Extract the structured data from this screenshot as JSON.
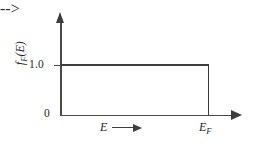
{
  "chart_data": {
    "type": "line",
    "title": "",
    "subtitle": "",
    "xlabel": "E",
    "ylabel": "f",
    "ylabel_sub": "F",
    "ylabel_arg": "(E)",
    "ylabel_full": "f_F(E)",
    "xlabel_arrow": "→",
    "x_tick_labels": [
      "0",
      "E_F"
    ],
    "y_tick_labels": [
      "0",
      "1.0"
    ],
    "y_tick_values": [
      0,
      1.0
    ],
    "ylim": [
      0,
      1.15
    ],
    "xlim": [
      0,
      1.2
    ],
    "grid": false,
    "legend": false,
    "series": [
      {
        "name": "Fermi-Dirac distribution at T = 0 K",
        "x": [
          0,
          1.0,
          1.0,
          1.2
        ],
        "values": [
          1.0,
          1.0,
          0,
          0
        ]
      }
    ],
    "annotations": [
      {
        "name": "fermi-energy-marker",
        "text": "E_F",
        "x": 1.0,
        "y": 0
      },
      {
        "name": "x-axis-direction-arrow",
        "text": "E →",
        "x": 0.5,
        "y": 0
      }
    ],
    "axis_arrows": {
      "x": true,
      "y": true
    },
    "line_color": "#3d3d3d",
    "axis_color": "#4a4a4a",
    "background_color": "#ffffff"
  },
  "axes": {
    "y_tick_one": "1.0",
    "origin_label": "0",
    "y_title_f": "f",
    "y_title_sub": "F",
    "y_title_paren": "(E)",
    "x_title": "E",
    "ef_label_main": "E",
    "ef_label_sub": "F"
  }
}
